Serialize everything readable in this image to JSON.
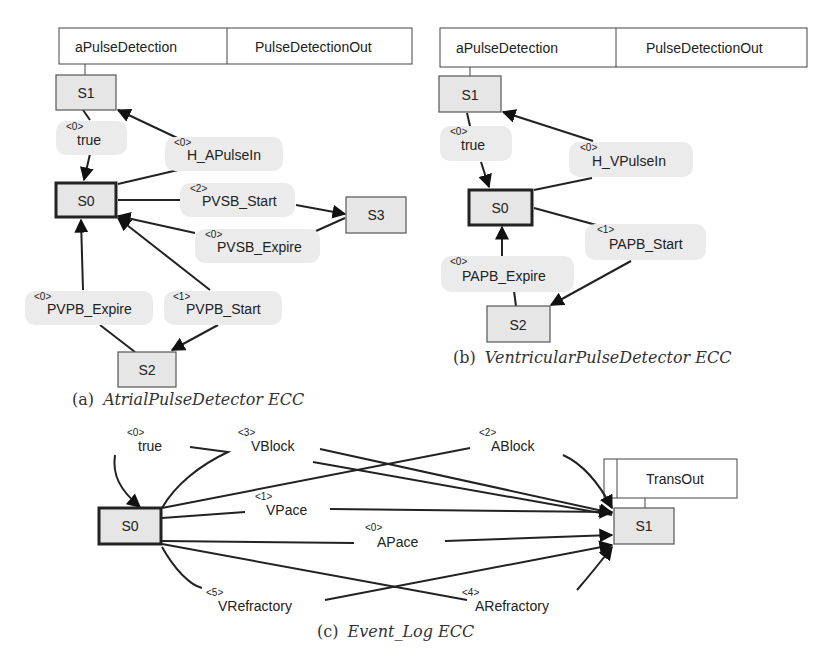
{
  "figure_a": {
    "caption_prefix": "(a)",
    "caption_name": "AtrialPulseDetector ECC",
    "header": {
      "action": "aPulseDetection",
      "output": "PulseDetectionOut"
    },
    "states": [
      "S1",
      "S0",
      "S3",
      "S2"
    ],
    "transitions": [
      {
        "priority": "<0>",
        "label": "true"
      },
      {
        "priority": "<0>",
        "label": "H_APulseIn"
      },
      {
        "priority": "<2>",
        "label": "PVSB_Start"
      },
      {
        "priority": "<0>",
        "label": "PVSB_Expire"
      },
      {
        "priority": "<0>",
        "label": "PVPB_Expire"
      },
      {
        "priority": "<1>",
        "label": "PVPB_Start"
      }
    ]
  },
  "figure_b": {
    "caption_prefix": "(b)",
    "caption_name": "VentricularPulseDetector ECC",
    "header": {
      "action": "aPulseDetection",
      "output": "PulseDetectionOut"
    },
    "states": [
      "S1",
      "S0",
      "S2"
    ],
    "transitions": [
      {
        "priority": "<0>",
        "label": "true"
      },
      {
        "priority": "<0>",
        "label": "H_VPulseIn"
      },
      {
        "priority": "<1>",
        "label": "PAPB_Start"
      },
      {
        "priority": "<0>",
        "label": "PAPB_Expire"
      }
    ]
  },
  "figure_c": {
    "caption_prefix": "(c)",
    "caption_name": "Event_Log ECC",
    "header": {
      "output": "TransOut"
    },
    "states": [
      "S0",
      "S1"
    ],
    "transitions": [
      {
        "priority": "<0>",
        "label": "true"
      },
      {
        "priority": "<3>",
        "label": "VBlock"
      },
      {
        "priority": "<2>",
        "label": "ABlock"
      },
      {
        "priority": "<1>",
        "label": "VPace"
      },
      {
        "priority": "<0>",
        "label": "APace"
      },
      {
        "priority": "<5>",
        "label": "VRefractory"
      },
      {
        "priority": "<4>",
        "label": "ARefractory"
      }
    ]
  }
}
